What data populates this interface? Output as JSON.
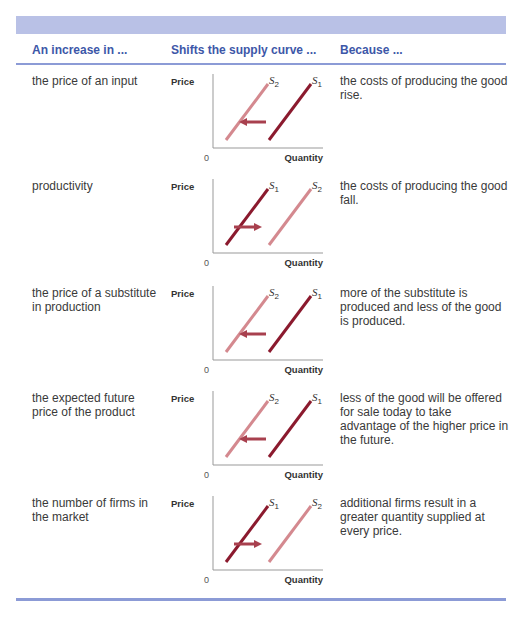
{
  "table": {
    "headers": [
      "An increase in ...",
      "Shifts the supply curve ...",
      "Because ..."
    ],
    "axis": {
      "y_label": "Price",
      "x_label": "Quantity",
      "origin": "0"
    },
    "colors": {
      "header_band": "#b9c1e6",
      "header_text": "#3d57a8",
      "rule": "#8c9bd6",
      "original_curve": "#8b1a2e",
      "shifted_curve": "#d4898f",
      "arrow": "#a8404e"
    },
    "rows": [
      {
        "cause": "the price of an input",
        "direction": "left",
        "left_curve": {
          "name": "S",
          "sub": "2"
        },
        "right_curve": {
          "name": "S",
          "sub": "1"
        },
        "reason": "the costs of producing the good rise."
      },
      {
        "cause": "productivity",
        "direction": "right",
        "left_curve": {
          "name": "S",
          "sub": "1"
        },
        "right_curve": {
          "name": "S",
          "sub": "2"
        },
        "reason": "the costs of producing the good fall."
      },
      {
        "cause": "the price of a substitute in production",
        "direction": "left",
        "left_curve": {
          "name": "S",
          "sub": "2"
        },
        "right_curve": {
          "name": "S",
          "sub": "1"
        },
        "reason": "more of the substitute is produced and less of the good is produced."
      },
      {
        "cause": "the expected future price of the product",
        "direction": "left",
        "left_curve": {
          "name": "S",
          "sub": "2"
        },
        "right_curve": {
          "name": "S",
          "sub": "1"
        },
        "reason": "less of the good will be offered for sale today to take advantage of the higher price in the future."
      },
      {
        "cause": "the number of firms in the market",
        "direction": "right",
        "left_curve": {
          "name": "S",
          "sub": "1"
        },
        "right_curve": {
          "name": "S",
          "sub": "2"
        },
        "reason": "additional firms result in a greater quantity supplied at every price."
      }
    ]
  }
}
